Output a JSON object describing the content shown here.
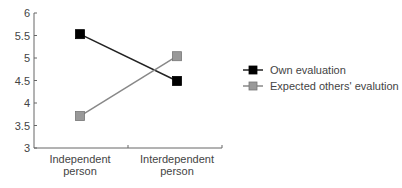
{
  "chart_data": {
    "type": "line",
    "title": "",
    "xlabel": "",
    "ylabel": "",
    "categories": [
      [
        "Independent",
        "person"
      ],
      [
        "Interdependent",
        "person"
      ]
    ],
    "ylim": [
      3,
      6
    ],
    "yticks": [
      "3",
      "3.5",
      "4",
      "4.5",
      "5",
      "5.5",
      "6"
    ],
    "ytick_values": [
      3,
      3.5,
      4,
      4.5,
      5,
      5.5,
      6
    ],
    "grid": false,
    "legend_position": "right",
    "series": [
      {
        "name": "Own evaluation",
        "values": [
          5.53,
          4.49
        ],
        "color": "#000000",
        "line_color": "#222222"
      },
      {
        "name": "Expected others' evalution",
        "values": [
          3.71,
          5.04
        ],
        "color": "#999999",
        "line_color": "#888888"
      }
    ]
  }
}
